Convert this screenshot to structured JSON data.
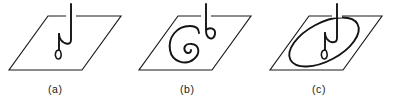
{
  "figure": {
    "caption_labels": [
      "(a)",
      "(b)",
      "(c)"
    ],
    "panel_count": 3,
    "background_color": "#ffffff",
    "line_color": "#1a1a1a",
    "curve_color": "#141414",
    "panels": [
      {
        "id": "a",
        "label": "(a)",
        "label_x": 48,
        "label_y": 93,
        "description": "plane with single hooked strand",
        "plane": {
          "points": "48,16 121,16 82,70 9,70"
        },
        "curve_main": "M71,4 L71,40 C71,46 64,44 61,40 C59,37 59,36 59,34",
        "curve_secondary": "M59,34 L59,50",
        "curve_loop": "M59,50 C55.6,50 54.4,54.6 56,57.4 C57.3,59.7 60.2,59.4 60.9,56.8 C61.6,54.2 60.6,50 59,50 Z",
        "mask_segments": [
          "M66,16 L76,16"
        ]
      },
      {
        "id": "b",
        "label": "(b)",
        "label_x": 180,
        "label_y": 93,
        "description": "plane with large spiral loop and small loop",
        "plane": {
          "points": "178,16 251,16 212,70 139,70"
        },
        "curve_main": "M206,4 L206,30 C206,40 214,41 215,34 C215.8,28.6 210,26.5 206,30",
        "curve_secondary": "M190,26 C176,26 168,38 170,50 C172,62 186,66 194,59 C201,53 199,45 192,44 C186,43 183,47 185,51 C186.5,54 191,53.5 191,50",
        "curve_loop": "M190,26 C196,26 199,29 199,33",
        "mask_segments": [
          "M201,16 L211,16"
        ]
      },
      {
        "id": "c",
        "label": "(c)",
        "label_x": 312,
        "label_y": 93,
        "description": "plane with large ellipse and descending stem",
        "plane": {
          "points": "309,16 382,16 343,70 270,70"
        },
        "curve_main": "M337,4 L337,38 C337,44 330,43 327,39 C325,36 325,35 325,33",
        "curve_secondary": "M325,33 L325,50",
        "curve_loop": "M325,50 C321.6,50 320.4,54.6 322,57.4 C323.3,59.7 326.2,59.4 326.9,56.8 C327.6,54.2 326.6,50 325,50 Z",
        "ellipse": {
          "cx": 324,
          "cy": 42,
          "rx": 38,
          "ry": 19,
          "rotation": -28
        },
        "mask_segments": [
          "M332,16 L342,16"
        ]
      }
    ]
  }
}
